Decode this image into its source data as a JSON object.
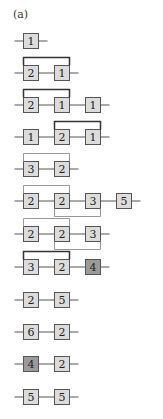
{
  "panel_label": "(a)",
  "colors": {
    "line": "#555555",
    "box_fill": "#dcdcdc",
    "box_fill_dark": "#9a9a9a",
    "box_stroke": "#555555",
    "bracket_dark": "#333333",
    "bracket_light": "#999999",
    "text": "#222222"
  },
  "rows": [
    {
      "boxes": [
        {
          "label": "1"
        }
      ],
      "top_bracket": null,
      "bottom_bracket": null
    },
    {
      "boxes": [
        {
          "label": "2"
        },
        {
          "label": "1"
        }
      ],
      "top_bracket": [
        0,
        1
      ],
      "bottom_bracket": null
    },
    {
      "boxes": [
        {
          "label": "2"
        },
        {
          "label": "1"
        },
        {
          "label": "1"
        }
      ],
      "top_bracket": [
        0,
        1
      ],
      "bottom_bracket": null
    },
    {
      "boxes": [
        {
          "label": "1"
        },
        {
          "label": "2"
        },
        {
          "label": "1"
        }
      ],
      "top_bracket": [
        1,
        2
      ],
      "bottom_bracket": null
    },
    {
      "boxes": [
        {
          "label": "3"
        },
        {
          "label": "2"
        }
      ],
      "top_bracket": [
        0,
        1
      ],
      "top_light": true,
      "bottom_bracket": null
    },
    {
      "boxes": [
        {
          "label": "2"
        },
        {
          "label": "2"
        },
        {
          "label": "3"
        },
        {
          "label": "5"
        }
      ],
      "top_bracket": [
        0,
        1
      ],
      "top_light": true,
      "bottom_bracket": [
        1,
        2
      ]
    },
    {
      "boxes": [
        {
          "label": "2"
        },
        {
          "label": "2"
        },
        {
          "label": "3"
        }
      ],
      "top_bracket": [
        0,
        1
      ],
      "top_light": true,
      "bottom_bracket": [
        1,
        2
      ]
    },
    {
      "boxes": [
        {
          "label": "3"
        },
        {
          "label": "2"
        },
        {
          "label": "4",
          "dark": true
        }
      ],
      "top_bracket": [
        0,
        1
      ],
      "bottom_bracket": null
    },
    {
      "boxes": [
        {
          "label": "2"
        },
        {
          "label": "5"
        }
      ],
      "top_bracket": null,
      "bottom_bracket": null
    },
    {
      "boxes": [
        {
          "label": "6"
        },
        {
          "label": "2"
        }
      ],
      "top_bracket": null,
      "bottom_bracket": null
    },
    {
      "boxes": [
        {
          "label": "4",
          "dark": true
        },
        {
          "label": "2"
        }
      ],
      "top_bracket": null,
      "bottom_bracket": null
    },
    {
      "boxes": [
        {
          "label": "5"
        },
        {
          "label": "5"
        }
      ],
      "top_bracket": null,
      "bottom_bracket": null
    }
  ]
}
